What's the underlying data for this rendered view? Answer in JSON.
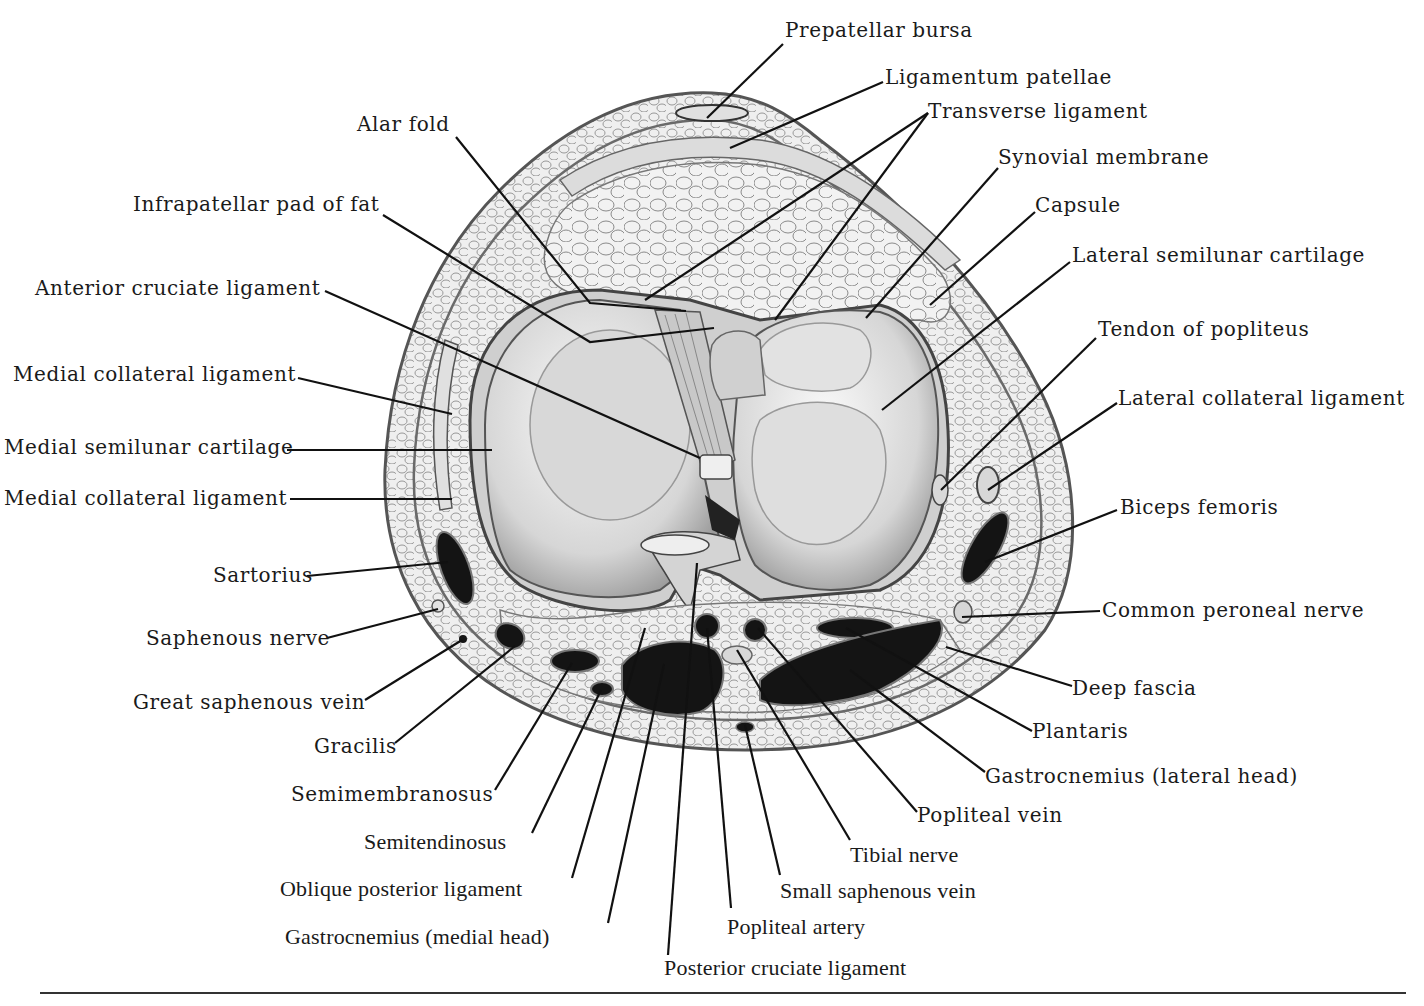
{
  "figure": {
    "labels": [
      {
        "id": "prepatellar-bursa",
        "text": "Prepatellar bursa",
        "x": 785,
        "y": 18,
        "line": [
          [
            783,
            44
          ],
          [
            707,
            118
          ]
        ]
      },
      {
        "id": "ligamentum-patellae",
        "text": "Ligamentum patellae",
        "x": 885,
        "y": 65,
        "line": [
          [
            883,
            82
          ],
          [
            730,
            148
          ]
        ]
      },
      {
        "id": "transverse-ligament",
        "text": "Transverse ligament",
        "x": 928,
        "y": 99,
        "line": [
          [
            928,
            113
          ],
          [
            645,
            300
          ],
          [
            928,
            113
          ],
          [
            775,
            320
          ]
        ]
      },
      {
        "id": "alar-fold",
        "text": "Alar fold",
        "x": 357,
        "y": 112,
        "line": [
          [
            456,
            137
          ],
          [
            590,
            303
          ],
          [
            686,
            311
          ]
        ]
      },
      {
        "id": "synovial-membrane",
        "text": "Synovial membrane",
        "x": 998,
        "y": 145,
        "line": [
          [
            998,
            168
          ],
          [
            866,
            318
          ]
        ]
      },
      {
        "id": "infrapatellar-pad-of-fat",
        "text": "Infrapatellar pad of fat",
        "x": 133,
        "y": 192,
        "line": [
          [
            383,
            215
          ],
          [
            590,
            342
          ],
          [
            714,
            328
          ]
        ]
      },
      {
        "id": "capsule",
        "text": "Capsule",
        "x": 1035,
        "y": 193,
        "line": [
          [
            1035,
            212
          ],
          [
            930,
            305
          ]
        ]
      },
      {
        "id": "lateral-semilunar-cartilage",
        "text": "Lateral semilunar cartilage",
        "x": 1072,
        "y": 243,
        "line": [
          [
            1070,
            262
          ],
          [
            882,
            410
          ]
        ]
      },
      {
        "id": "anterior-cruciate-ligament",
        "text": "Anterior cruciate ligament",
        "x": 35,
        "y": 276,
        "line": [
          [
            325,
            291
          ],
          [
            700,
            458
          ]
        ]
      },
      {
        "id": "tendon-of-popliteus",
        "text": "Tendon of popliteus",
        "x": 1098,
        "y": 317,
        "line": [
          [
            1096,
            338
          ],
          [
            941,
            490
          ]
        ]
      },
      {
        "id": "medial-collateral-ligament-upper",
        "text": "Medial collateral ligament",
        "x": 13,
        "y": 362,
        "line": [
          [
            298,
            378
          ],
          [
            452,
            414
          ]
        ]
      },
      {
        "id": "lateral-collateral-ligament",
        "text": "Lateral collateral ligament",
        "x": 1118,
        "y": 386,
        "line": [
          [
            1117,
            403
          ],
          [
            988,
            490
          ]
        ]
      },
      {
        "id": "medial-semilunar-cartilage",
        "text": "Medial semilunar cartilage",
        "x": 4,
        "y": 435,
        "line": [
          [
            287,
            450
          ],
          [
            492,
            450
          ]
        ]
      },
      {
        "id": "medial-collateral-ligament-lower",
        "text": "Medial collateral ligament",
        "x": 4,
        "y": 486,
        "line": [
          [
            290,
            499
          ],
          [
            452,
            499
          ]
        ]
      },
      {
        "id": "biceps-femoris",
        "text": "Biceps femoris",
        "x": 1120,
        "y": 495,
        "line": [
          [
            1117,
            510
          ],
          [
            985,
            562
          ]
        ]
      },
      {
        "id": "sartorius",
        "text": "Sartorius",
        "x": 213,
        "y": 563,
        "line": [
          [
            307,
            576
          ],
          [
            448,
            562
          ]
        ]
      },
      {
        "id": "common-peroneal-nerve",
        "text": "Common peroneal nerve",
        "x": 1102,
        "y": 598,
        "line": [
          [
            1100,
            611
          ],
          [
            962,
            617
          ]
        ]
      },
      {
        "id": "saphenous-nerve",
        "text": "Saphenous nerve",
        "x": 146,
        "y": 626,
        "line": [
          [
            327,
            638
          ],
          [
            438,
            609
          ]
        ]
      },
      {
        "id": "deep-fascia",
        "text": "Deep fascia",
        "x": 1072,
        "y": 676,
        "line": [
          [
            1072,
            686
          ],
          [
            946,
            647
          ]
        ]
      },
      {
        "id": "great-saphenous-vein",
        "text": "Great saphenous vein",
        "x": 133,
        "y": 690,
        "line": [
          [
            365,
            700
          ],
          [
            462,
            640
          ]
        ]
      },
      {
        "id": "plantaris",
        "text": "Plantaris",
        "x": 1032,
        "y": 719,
        "line": [
          [
            1032,
            731
          ],
          [
            846,
            628
          ]
        ]
      },
      {
        "id": "gracilis",
        "text": "Gracilis",
        "x": 314,
        "y": 734,
        "line": [
          [
            395,
            743
          ],
          [
            515,
            646
          ]
        ]
      },
      {
        "id": "gastrocnemius-lateral-head",
        "text": "Gastrocnemius (lateral head)",
        "x": 985,
        "y": 764,
        "line": [
          [
            985,
            772
          ],
          [
            850,
            670
          ]
        ]
      },
      {
        "id": "semimembranosus",
        "text": "Semimembranosus",
        "x": 291,
        "y": 782,
        "line": [
          [
            495,
            790
          ],
          [
            572,
            663
          ]
        ]
      },
      {
        "id": "popliteal-vein",
        "text": "Popliteal vein",
        "x": 917,
        "y": 803,
        "line": [
          [
            917,
            812
          ],
          [
            758,
            628
          ]
        ]
      },
      {
        "id": "semitendinosus",
        "text": "Semitendinosus",
        "x": 364,
        "y": 830,
        "line": [
          [
            532,
            833
          ],
          [
            601,
            690
          ]
        ]
      },
      {
        "id": "tibial-nerve",
        "text": "Tibial nerve",
        "x": 850,
        "y": 843,
        "line": [
          [
            850,
            840
          ],
          [
            737,
            650
          ]
        ]
      },
      {
        "id": "oblique-posterior-ligament",
        "text": "Oblique posterior ligament",
        "x": 280,
        "y": 877,
        "line": [
          [
            572,
            878
          ],
          [
            645,
            628
          ]
        ]
      },
      {
        "id": "small-saphenous-vein",
        "text": "Small saphenous vein",
        "x": 780,
        "y": 879,
        "line": [
          [
            780,
            875
          ],
          [
            745,
            725
          ]
        ]
      },
      {
        "id": "gastrocnemius-medial-head",
        "text": "Gastrocnemius (medial head)",
        "x": 285,
        "y": 925,
        "line": [
          [
            608,
            923
          ],
          [
            664,
            664
          ]
        ]
      },
      {
        "id": "popliteal-artery",
        "text": "Popliteal artery",
        "x": 727,
        "y": 915,
        "line": [
          [
            731,
            908
          ],
          [
            707,
            628
          ]
        ]
      },
      {
        "id": "posterior-cruciate-ligament",
        "text": "Posterior cruciate ligament",
        "x": 664,
        "y": 956,
        "line": [
          [
            668,
            955
          ],
          [
            697,
            563
          ]
        ]
      }
    ]
  },
  "colors": {
    "ink": "#1a1a1a",
    "tissue_light": "#eeeeee",
    "tissue_mid": "#bdbdbd",
    "tissue_dark": "#7a7a7a",
    "muscle": "#141414",
    "background": "#ffffff"
  }
}
